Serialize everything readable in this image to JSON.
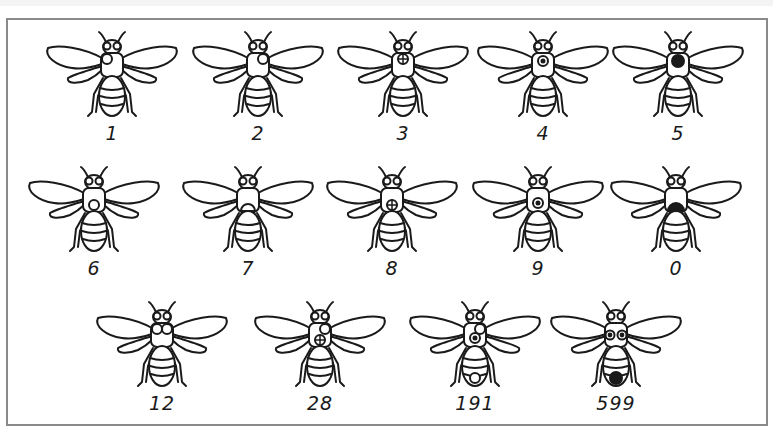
{
  "figure": {
    "stroke_color": "#1a1a1a",
    "frame_color": "#8a8a8a",
    "bees": [
      {
        "label": "1",
        "marks": [
          "thorax-top-left-circle"
        ]
      },
      {
        "label": "2",
        "marks": [
          "thorax-top-right-circle"
        ]
      },
      {
        "label": "3",
        "marks": [
          "thorax-top-quartered-circle"
        ]
      },
      {
        "label": "4",
        "marks": [
          "thorax-top-ringed-dot"
        ]
      },
      {
        "label": "5",
        "marks": [
          "thorax-top-solid"
        ]
      },
      {
        "label": "6",
        "marks": [
          "thorax-bottom-circle"
        ]
      },
      {
        "label": "7",
        "marks": [
          "thorax-bottom-semicircle"
        ]
      },
      {
        "label": "8",
        "marks": [
          "thorax-bottom-quartered-circle"
        ]
      },
      {
        "label": "9",
        "marks": [
          "thorax-bottom-ringed-dot"
        ]
      },
      {
        "label": "0",
        "marks": [
          "thorax-bottom-solid"
        ]
      },
      {
        "label": "12",
        "marks": [
          "thorax-top-left-circle",
          "thorax-top-right-circle"
        ]
      },
      {
        "label": "28",
        "marks": [
          "thorax-top-right-circle",
          "thorax-bottom-quartered-circle"
        ]
      },
      {
        "label": "191",
        "marks": [
          "thorax-top-right-circle",
          "thorax-bottom-ringed-dot",
          "abdomen-tip-circle"
        ]
      },
      {
        "label": "599",
        "marks": [
          "thorax-ringed-dot-pair",
          "abdomen-tip-solid"
        ]
      }
    ]
  }
}
